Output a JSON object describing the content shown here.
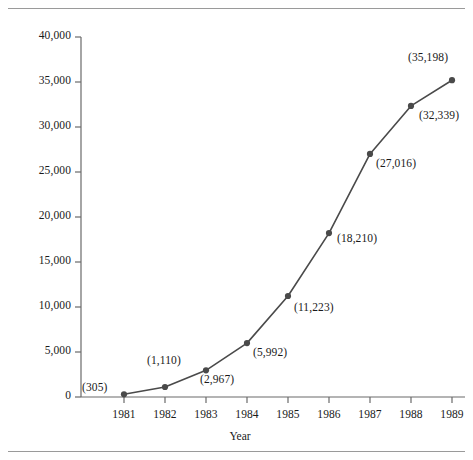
{
  "figure": {
    "background_color": "#ffffff",
    "rule_color": "#9a9a9a",
    "has_top_rule": true,
    "has_bottom_rule": true
  },
  "chart_data": {
    "type": "line",
    "title": "",
    "subtitle": "",
    "xlabel": "Year",
    "ylabel": "",
    "categories": [
      "1981",
      "1982",
      "1983",
      "1984",
      "1985",
      "1986",
      "1987",
      "1988",
      "1989"
    ],
    "values": [
      305,
      1110,
      2967,
      5992,
      11223,
      18210,
      27016,
      32339,
      35198
    ],
    "point_labels": [
      "(305)",
      "(1,110)",
      "(2,967)",
      "(5,992)",
      "(11,223)",
      "(18,210)",
      "(27,016)",
      "(32,339)",
      "(35,198)"
    ],
    "ylim": [
      0,
      40000
    ],
    "xlim": [
      "1981",
      "1989"
    ],
    "ytick_values": [
      0,
      5000,
      10000,
      15000,
      20000,
      25000,
      30000,
      35000,
      40000
    ],
    "ytick_labels": [
      "0",
      "5,000",
      "10,000",
      "15,000",
      "20,000",
      "25,000",
      "30,000",
      "35,000",
      "40,000"
    ],
    "xtick_labels": [
      "1981",
      "1982",
      "1983",
      "1984",
      "1985",
      "1986",
      "1987",
      "1988",
      "1989"
    ],
    "grid": false,
    "legend": false,
    "legend_position": "none",
    "series": [
      {
        "name": "",
        "values": [
          305,
          1110,
          2967,
          5992,
          11223,
          18210,
          27016,
          32339,
          35198
        ],
        "line_color": "#4a4a4a",
        "marker": "circle",
        "marker_color": "#4a4a4a"
      }
    ],
    "axis_color": "#6a6a6a"
  },
  "geometry": {
    "plot_left": 81,
    "plot_right": 465,
    "plot_top": 37,
    "plot_bottom": 397,
    "x_first": 124,
    "x_step": 41,
    "y_zero": 397,
    "y_per_unit": 0.009
  },
  "label_offsets": [
    {
      "dx": -42,
      "dy": -6
    },
    {
      "dx": -18,
      "dy": -26
    },
    {
      "dx": -6,
      "dy": 10
    },
    {
      "dx": 6,
      "dy": 10
    },
    {
      "dx": 6,
      "dy": 12
    },
    {
      "dx": 8,
      "dy": 6
    },
    {
      "dx": 6,
      "dy": 10
    },
    {
      "dx": 8,
      "dy": 10
    },
    {
      "dx": -44,
      "dy": -22
    }
  ]
}
